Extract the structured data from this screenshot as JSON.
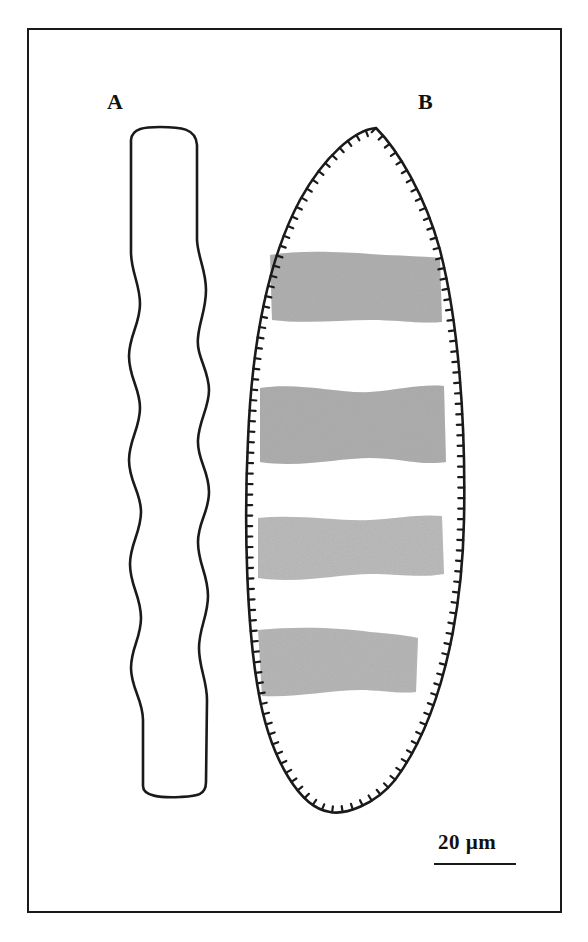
{
  "figure": {
    "panels": [
      {
        "id": "A",
        "label": "A",
        "description": "Smooth undulating elongated outline"
      },
      {
        "id": "B",
        "label": "B",
        "description": "Elliptical outline with marginal denticles and four shaded transverse bands"
      }
    ],
    "scale_bar": {
      "label": "20 µm",
      "value": 20,
      "unit": "µm"
    },
    "colors": {
      "line": "#1a1a1a",
      "band_fill": "#9a9a9a",
      "background": "#ffffff"
    }
  }
}
